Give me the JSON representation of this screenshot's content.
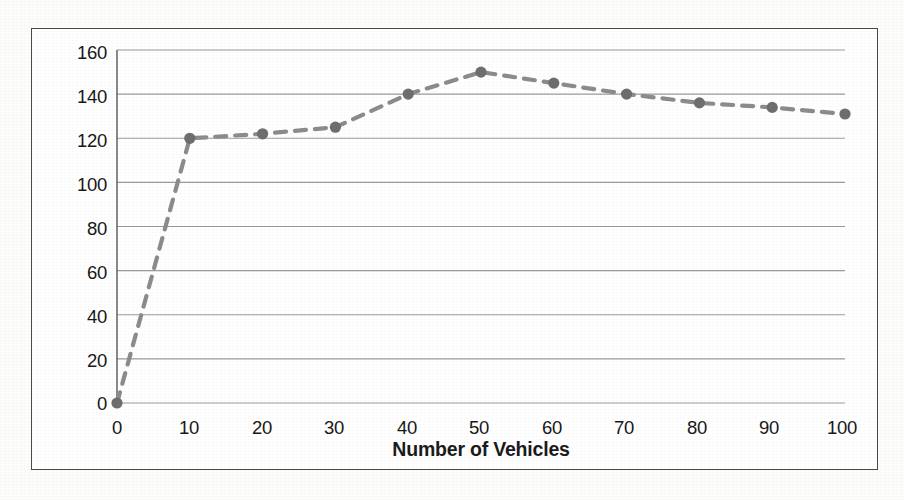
{
  "figure": {
    "frame_color": "#4a4a4a",
    "background": "#ffffff"
  },
  "chart_data": {
    "type": "line",
    "title": "",
    "subtitle": "",
    "xlabel": "Number of Vehicles",
    "ylabel": "Throughput in Kbps",
    "x": [
      0,
      10,
      20,
      30,
      40,
      50,
      60,
      70,
      80,
      90,
      100
    ],
    "values": [
      0,
      120,
      122,
      125,
      140,
      150,
      145,
      140,
      136,
      134,
      131
    ],
    "series": [
      {
        "name": "Throughput",
        "values": [
          0,
          120,
          122,
          125,
          140,
          150,
          145,
          140,
          136,
          134,
          131
        ]
      }
    ],
    "xlim": [
      0,
      100
    ],
    "ylim": [
      0,
      160
    ],
    "xticks": [
      "0",
      "10",
      "20",
      "30",
      "40",
      "50",
      "60",
      "70",
      "80",
      "90",
      "100"
    ],
    "yticks": [
      "0",
      "20",
      "40",
      "60",
      "80",
      "100",
      "120",
      "140",
      "160"
    ],
    "grid": "horizontal",
    "legend": "none",
    "line_style": "dashed",
    "line_color": "#8c8c8c",
    "marker": "circle",
    "marker_color": "#6e6e6e",
    "annotations": []
  }
}
